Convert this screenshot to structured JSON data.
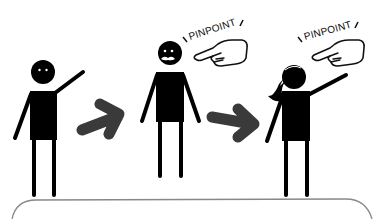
{
  "scene": {
    "description": "Three stick figures: the left one points, the middle one is being pinpointed, the right one (a girl with ponytail) points back with a 'PINPOINT' callout",
    "colors": {
      "figure": "#000000",
      "arrow": "#3a3a3a",
      "panel_border": "#888888",
      "background": "#ffffff"
    }
  },
  "figures": [
    {
      "id": "left-person",
      "pose": "pointing-up-right"
    },
    {
      "id": "middle-person",
      "pose": "standing-arms-down",
      "expression": "mustache"
    },
    {
      "id": "right-person",
      "pose": "pointing-up-right",
      "hair": "ponytail"
    }
  ],
  "callouts": [
    {
      "id": "callout-middle",
      "text": "PINPOINT",
      "icon": "pointing-hand-icon"
    },
    {
      "id": "callout-right",
      "text": "PINPOINT",
      "icon": "pointing-hand-icon"
    }
  ],
  "arrows": [
    {
      "id": "arrow-1",
      "direction": "up-right"
    },
    {
      "id": "arrow-2",
      "direction": "right"
    }
  ],
  "panel": {
    "type": "rounded-speech-panel",
    "text": ""
  }
}
